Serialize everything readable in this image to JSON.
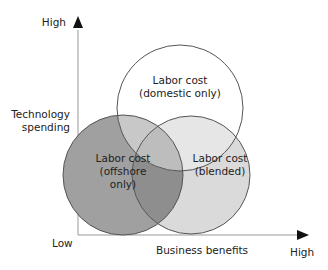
{
  "diagram": {
    "type": "venn",
    "y_axis": {
      "label": "Technology spending",
      "label_lines": [
        "Technology",
        "spending"
      ],
      "high": "High"
    },
    "x_axis": {
      "label": "Business benefits",
      "high": "High"
    },
    "origin_label": "Low",
    "circles": [
      {
        "id": "domestic",
        "lines": [
          "Labor cost",
          "(domestic only)"
        ],
        "fill": "#ffffff"
      },
      {
        "id": "offshore",
        "lines": [
          "Labor cost",
          "(offshore",
          "only)"
        ],
        "fill": "#a0a0a0"
      },
      {
        "id": "blended",
        "lines": [
          "Labor cost",
          "(blended)"
        ],
        "fill": "#dadada"
      }
    ],
    "colors": {
      "stroke": "#555555",
      "axis": "#888888",
      "arrow": "#111111"
    }
  }
}
